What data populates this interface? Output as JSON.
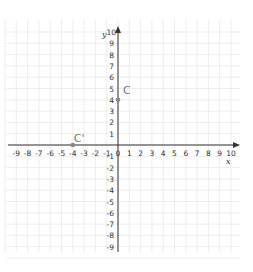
{
  "diagram": {
    "type": "coordinate-plane",
    "x_axis": {
      "label": "x",
      "range": [
        -9,
        10
      ],
      "tick_labels": [
        "-9",
        "-8",
        "-7",
        "-6",
        "-5",
        "-4",
        "-3",
        "-2",
        "-1",
        "0",
        "1",
        "2",
        "3",
        "4",
        "5",
        "6",
        "7",
        "8",
        "9",
        "10"
      ]
    },
    "y_axis": {
      "label": "y",
      "range": [
        -9,
        10
      ],
      "tick_labels": [
        "10",
        "9",
        "8",
        "7",
        "6",
        "5",
        "4",
        "3",
        "2",
        "1",
        "-1",
        "-2",
        "-3",
        "-4",
        "-5",
        "-6",
        "-7",
        "-8",
        "-9"
      ]
    },
    "points": [
      {
        "name": "C",
        "x": 0,
        "y": 4,
        "color": "#888888"
      },
      {
        "name": "C'",
        "x": -4,
        "y": 0,
        "color": "#888888"
      }
    ],
    "colors": {
      "axis": "#333333",
      "grid": "#e6e6e6",
      "point": "#888888",
      "background": "#ffffff"
    }
  }
}
